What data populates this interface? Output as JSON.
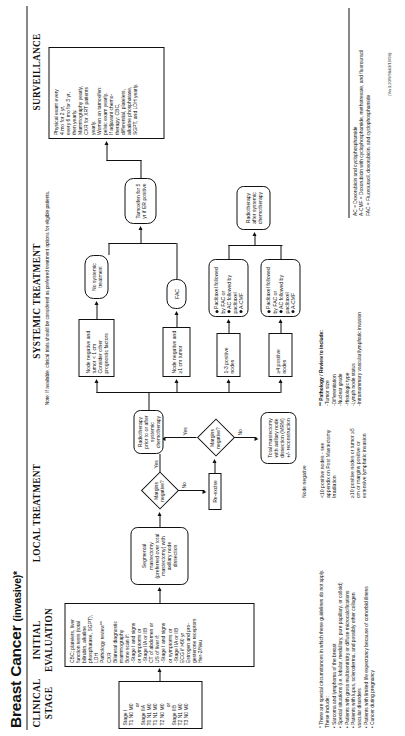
{
  "title": {
    "main": "Breast Cancer",
    "qualifier": "(invasive)*"
  },
  "columns": [
    {
      "id": "clinical-stage",
      "label": "CLINICAL\nSTAGE"
    },
    {
      "id": "initial-evaluation",
      "label": "INITIAL\nEVALUATION"
    },
    {
      "id": "local-treatment",
      "label": "LOCAL TREATMENT"
    },
    {
      "id": "systemic-treatment",
      "label": "SYSTEMIC TREATMENT"
    },
    {
      "id": "surveillance",
      "label": "SURVEILLANCE"
    }
  ],
  "systemic_note": "Note:  If available, clinical trials should be considered as preferred treatment options for eligible patients.",
  "stage_box": {
    "lines": [
      "Stage I",
      "T1 N0 M0",
      "or",
      "Stage  IIA",
      "T0 N1 M0",
      "T1 N1 M0",
      "T2 N0 M0",
      "or",
      "Stage  IIB",
      "T2 N1 M0",
      "T3 N0 M0"
    ]
  },
  "evaluation_box": {
    "lines": [
      "CBC; platelets, liver",
      "function tests (total",
      "bilirubin, alkaline",
      "phosphatase, SGPT),",
      "LDH",
      "Pathology review**",
      "CXR",
      "Bilateral diagnostic",
      "mammography",
      "Bone scan if:",
      "  -Stage I and signs",
      "   or symptoms or",
      "  -Stage IIA or IIB",
      "CT of abdomen or",
      "US of liver if:",
      "  -Stage I and signs",
      "   or symptoms or",
      "  -Stage IIA or IIB",
      "ECG if >60 yr",
      "Estrogen and pro-",
      "gesterone receptors",
      "Her-2/Neu"
    ]
  },
  "local_treatment": {
    "segmental": "Segmental mastectomy (preferred over total mastectomy) with axillary node dissection",
    "margins_q": "Margins negative?",
    "reexcise": "Re-excise",
    "margins_q2": "Margins negative?",
    "radiotherapy_prior": "Radiotherapy prior to or after systemic chemotherapy",
    "total_mastectomy": "Total mastectomy with axillary node dissection (MRM) +/- reconstruction",
    "yes": "Yes",
    "no": "No"
  },
  "systemic_treatment": {
    "node_neg_small": "Node negative and tumor < 1 cm Consider other prognostic factors",
    "no_systemic": "No systemic treatment",
    "node_neg_large": "Node negative and ≥1 cm tumor",
    "fac": "FAC",
    "nodes_1_3": "1-3 positive nodes",
    "nodes_4plus": "≥4 positive nodes",
    "regimen_a": [
      "Paclitaxel followed by FAC or",
      "AC followed by paclitaxel"
    ],
    "regimen_b": [
      "Paclitaxel followed by FAC or",
      "AC followed by paclitaxel",
      "A-CMF"
    ],
    "regimen_c": [
      "Paclitaxel followed by FAC or",
      "AC followed by paclitaxel",
      "A-CMF"
    ],
    "radiotherapy_after": "Radiotherapy after systemic chemotherapy",
    "tamoxifen": "Tamoxifen for 5 yr if ER positive",
    "node_negative_label": "Node negative",
    "lt10_nodes": "<10 positive nodes - see appendix on Post Mastectomy Irradiation",
    "ge10_nodes": "≥10 positive nodes or tumor  ≥5 cm or margins positive or extensive lymphatic invasion"
  },
  "surveillance": {
    "lines": [
      "Physical exam every",
      "  4 mo for 2 yr,",
      "  every 6 mo for 3 yr,",
      "  then yearly.",
      "Mammography yearly,",
      "  CXR for XRT patients",
      "  yearly.",
      "Women on tamoxifen:",
      "  pelvic exam yearly.",
      "If adjuvant chemo-",
      "  therapy: CBC,",
      "  differential, platelets,",
      "  alkaline phosphatase,",
      "  SGPT, and LDH yearly."
    ]
  },
  "footnote_pathology": {
    "title": "** Pathology / Review to include:",
    "items": [
      "-Tumor size",
      "-Differentiation",
      "-Nuclear grade",
      "-Histologic type",
      "-Lymph node status",
      "-Intramammary vascular/lymphatic invasion"
    ]
  },
  "footnote_special": {
    "title": "*   There are special circumstances in which these guidelines do not apply.",
    "items": [
      "These include:",
      "• Sarcoma and lymphoma of the breast",
      "• Special situations (i.e. lobular, medullary, pure papillary, or colloid)",
      "• Patients with gross multicentricity or diffuse microcalcifications",
      "• Patients with lupus, scleroderma, and possibly other collagen",
      "   vascular disorders",
      "• Patients with limited life expectancy because of comorbid illness",
      "• Cancer during pregnancy"
    ]
  },
  "abbreviations": [
    "AC = Doxorubicin and cyclophosphamide",
    "A-CMF = Doxorubicin with cyclophosphamide, methotrexate, and fluorouracil",
    "FAC = Fluorouracil, doxorubicin, and cyclophosphamide"
  ],
  "citation": "(Ver3;20/9/98&3/19/98)"
}
